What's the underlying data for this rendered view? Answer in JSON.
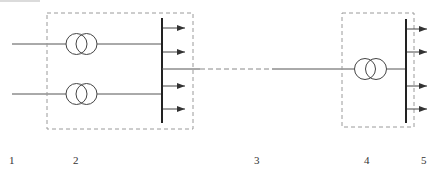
{
  "diagram": {
    "colors": {
      "line": "#555555",
      "bus": "#222222",
      "dashed_box": "#9a9a9a",
      "label": "#333333"
    },
    "components": {
      "incoming_lines": [
        {
          "id": "line-1",
          "y": 44,
          "x_start": 12,
          "x_end": 66
        },
        {
          "id": "line-2",
          "y": 94,
          "x_start": 12,
          "x_end": 66
        }
      ],
      "substation_left": {
        "box": {
          "x": 47,
          "y": 13,
          "w": 146,
          "h": 116
        },
        "transformers": [
          {
            "id": "T1",
            "cx1": 76,
            "cx2": 86,
            "cy": 44,
            "r": 10.5
          },
          {
            "id": "T2",
            "cx1": 76,
            "cx2": 86,
            "cy": 94,
            "r": 10.5
          }
        ],
        "bus": {
          "x": 162,
          "y1": 18,
          "y2": 123
        },
        "outgoing_feeders_y": [
          28,
          52,
          86,
          109
        ],
        "feeder_tip_x": 185
      },
      "transmission_line": {
        "y": 69,
        "solid_from_bus": {
          "x1": 162,
          "x2": 200
        },
        "dashed": {
          "x1": 200,
          "x2": 272
        },
        "solid": {
          "x1": 272,
          "x2": 354
        }
      },
      "substation_right": {
        "box": {
          "x": 342,
          "y": 13,
          "w": 72,
          "h": 114
        },
        "transformer": {
          "id": "T3",
          "cx1": 365,
          "cx2": 376,
          "cy": 69,
          "r": 10.5
        },
        "bus": {
          "x": 406,
          "y1": 19,
          "y2": 123
        },
        "outgoing_feeders_y": [
          29,
          52,
          86,
          109
        ],
        "feeder_tip_x": 427
      }
    },
    "labels": [
      {
        "text": "1",
        "x": 9,
        "y": 155
      },
      {
        "text": "2",
        "x": 73,
        "y": 155
      },
      {
        "text": "3",
        "x": 254,
        "y": 155
      },
      {
        "text": "4",
        "x": 364,
        "y": 155
      },
      {
        "text": "5",
        "x": 421,
        "y": 155
      }
    ]
  }
}
